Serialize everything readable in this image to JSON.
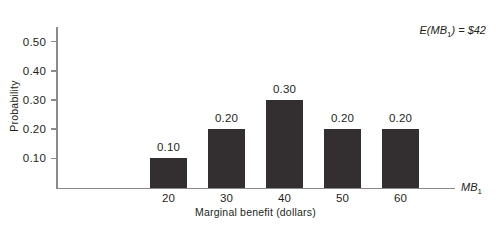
{
  "chart_data": {
    "type": "bar",
    "title": "",
    "xlabel": "Marginal benefit (dollars)",
    "ylabel": "Probability",
    "categories": [
      "20",
      "30",
      "40",
      "50",
      "60"
    ],
    "values": [
      0.1,
      0.2,
      0.3,
      0.2,
      0.2
    ],
    "value_labels": [
      "0.10",
      "0.20",
      "0.30",
      "0.20",
      "0.20"
    ],
    "ylim": [
      0,
      0.55
    ],
    "yticks": [
      0.1,
      0.2,
      0.3,
      0.4,
      0.5
    ],
    "ytick_labels": [
      "0.10",
      "0.20",
      "0.30",
      "0.40",
      "0.50"
    ],
    "grid": false,
    "legend": false,
    "bar_color": "#332f30",
    "axis_color": "#8a8a8a",
    "text_color": "#231f20",
    "annotations": [
      {
        "name": "expected-value",
        "text_prefix": "E(",
        "text_var": "MB",
        "text_sub": "1",
        "text_suffix": ") = $42",
        "full_text": "E(MB1) = $42"
      }
    ],
    "x_axis_end_label": {
      "var": "MB",
      "sub": "1"
    }
  },
  "axis": {
    "y_title": "Probability",
    "x_title": "Marginal benefit (dollars)"
  }
}
